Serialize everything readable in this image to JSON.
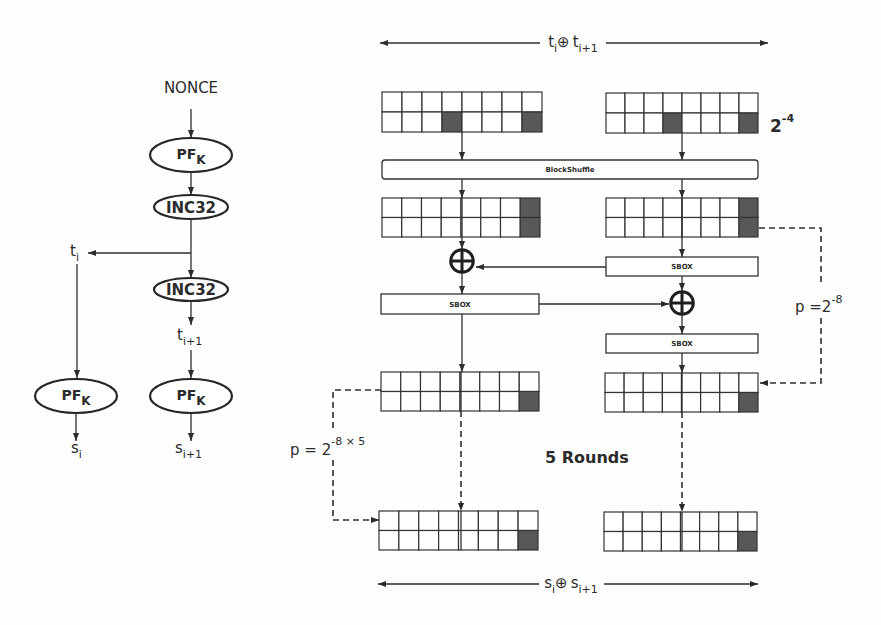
{
  "colors": {
    "stroke": "#333333",
    "cell_fill": "#ffffff",
    "active_cell": "#585858"
  },
  "header_span": {
    "left_var": "t",
    "left_sub": "i",
    "operator": "⊕",
    "right_var": "t",
    "right_sub": "i+1"
  },
  "footer_span": {
    "left_var": "s",
    "left_sub": "i",
    "operator": "⊕",
    "right_var": "s",
    "right_sub": "i+1"
  },
  "keystream_flow": {
    "nonce_label": "NONCE",
    "prf_top": {
      "name": "PF",
      "key": "K"
    },
    "inc_first": "INC32",
    "tweak_i": {
      "var": "t",
      "sub": "i"
    },
    "inc_second": "INC32",
    "tweak_next": {
      "var": "t",
      "sub": "i+1"
    },
    "prf_left": {
      "name": "PF",
      "key": "K"
    },
    "prf_right": {
      "name": "PF",
      "key": "K"
    },
    "output_i": {
      "var": "s",
      "sub": "i"
    },
    "output_next": {
      "var": "s",
      "sub": "i+1"
    }
  },
  "cipher_trail": {
    "block_shuffle_label": "BlockShuffle",
    "sbox_labels": [
      "SBOX",
      "SBOX",
      "SBOX"
    ],
    "input_probability": {
      "base": "2",
      "exponent": "-4"
    },
    "round_probability": {
      "prefix": "p =",
      "base": "2",
      "exponent": "-8"
    },
    "total_probability": {
      "prefix": "p = ",
      "base": "2",
      "exponent": "-8 × 5"
    },
    "rounds_label": "5 Rounds",
    "grid": {
      "rows": 2,
      "cols": 8
    },
    "states": [
      {
        "id": "input-left",
        "active_cells": [
          [
            1,
            3
          ],
          [
            1,
            7
          ]
        ]
      },
      {
        "id": "input-right",
        "active_cells": [
          [
            1,
            3
          ],
          [
            1,
            7
          ]
        ]
      },
      {
        "id": "shuffled-left",
        "active_cells": [
          [
            0,
            7
          ],
          [
            1,
            7
          ]
        ]
      },
      {
        "id": "shuffled-right",
        "active_cells": [
          [
            0,
            7
          ],
          [
            1,
            7
          ]
        ]
      },
      {
        "id": "round-left",
        "active_cells": [
          [
            1,
            7
          ]
        ]
      },
      {
        "id": "round-right",
        "active_cells": [
          [
            1,
            7
          ]
        ]
      },
      {
        "id": "output-left",
        "active_cells": [
          [
            1,
            7
          ]
        ]
      },
      {
        "id": "output-right",
        "active_cells": [
          [
            1,
            7
          ]
        ]
      }
    ]
  }
}
